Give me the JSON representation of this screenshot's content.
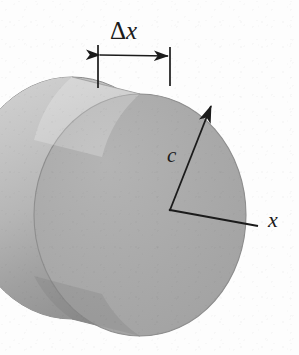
{
  "figure": {
    "background_color": "#fdfdfd",
    "ink_color": "#1b1b1b",
    "labels": {
      "thickness": {
        "delta": "Δ",
        "variable": "x",
        "full": "Δx"
      },
      "radius": "c",
      "axis": "x"
    },
    "solid": {
      "name": "circular-disc",
      "front_face_color": "#a9a9a9",
      "side_wall_light_color": "#cbcbcb",
      "side_wall_dark_color": "#8f8f8f",
      "back_face_color": "#b4b4b4",
      "outline_color": "#8a8a8a",
      "front_center_x": 140,
      "front_center_y": 215,
      "front_radius_x": 106,
      "front_radius_y": 121,
      "back_center_x": 72,
      "back_center_y": 198,
      "back_radius_x": 106,
      "back_radius_y": 121
    },
    "annotations": {
      "dimension_line": {
        "name": "delta-x-dimension",
        "left_extension_x": 98,
        "right_extension_x": 170,
        "extension_top_y": 45,
        "extension_bottom_y": 88,
        "arrow_y": 56,
        "double_headed": true
      },
      "radius_arrow": {
        "name": "radius-c-arrow",
        "origin_x": 170,
        "origin_y": 210,
        "tip_x": 212,
        "tip_y": 104
      },
      "axis_arrow": {
        "name": "x-axis-line",
        "origin_x": 170,
        "origin_y": 210,
        "end_x": 258,
        "end_y": 226
      }
    }
  }
}
